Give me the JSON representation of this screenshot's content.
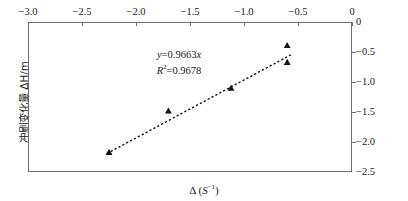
{
  "chart_data": {
    "type": "scatter",
    "title": "",
    "xlabel": "Δ ( S⁻¹ )",
    "ylabel": "冲刷变化量 ΔH/m",
    "xlim": [
      -3.0,
      0
    ],
    "ylim": [
      -2.5,
      0
    ],
    "grid": false,
    "legend": null,
    "x_axis_position": "top",
    "y_axis_position": "right",
    "xticks": [
      -3.0,
      -2.5,
      -2.0,
      -1.5,
      -1.0,
      -0.5,
      0
    ],
    "xticklabels": [
      "−3.0",
      "−2.5",
      "−2.0",
      "−1.5",
      "−1.0",
      "−0.5",
      "0"
    ],
    "yticks": [
      0,
      -0.5,
      -1.0,
      -1.5,
      -2.0,
      -2.5
    ],
    "yticklabels": [
      "0",
      "−0.5",
      "−1.0",
      "−1.5",
      "−2.0",
      "−2.5"
    ],
    "marker": "filled-triangle",
    "marker_color": "#111111",
    "points": [
      {
        "x": -2.25,
        "y": -2.17
      },
      {
        "x": -1.7,
        "y": -1.48
      },
      {
        "x": -1.12,
        "y": -1.1
      },
      {
        "x": -0.6,
        "y": -0.39
      },
      {
        "x": -0.6,
        "y": -0.67
      }
    ],
    "trendline": {
      "style": "dashed",
      "color": "#111111",
      "slope": 0.9663,
      "intercept": 0,
      "x_start": -2.27,
      "x_end": -0.55
    },
    "annotations": {
      "equation": "y=0.9663x",
      "equation_y": "y",
      "equation_rest": "=0.9663",
      "equation_x": "x",
      "r_squared_symbol": "R",
      "r_squared_exp": "2",
      "r_squared_value": "=0.9678"
    }
  },
  "axis": {
    "x_title_delta": "Δ (",
    "x_title_var": "S",
    "x_title_exp": "−1",
    "x_title_close": ")",
    "y_title": "冲刷变化量 ΔH/m"
  }
}
